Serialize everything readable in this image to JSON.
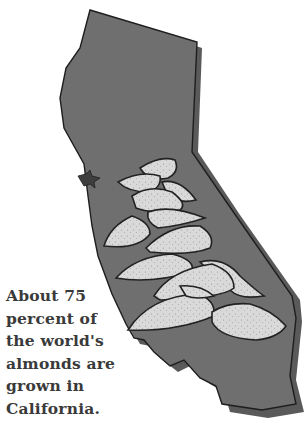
{
  "map": {
    "region": "California",
    "style": "grayscale illustration",
    "colors": {
      "state_fill": "#6f6f6f",
      "state_shadow": "#5a5a5a",
      "outline": "#1e1e1e",
      "almond_fill": "#d9d9d9",
      "background": "#ffffff",
      "caption_text": "#3a3a3a"
    },
    "almond_count": 13
  },
  "caption": {
    "lines": [
      "About 75",
      "percent of",
      "the world's",
      "almonds are",
      "grown in",
      "California."
    ]
  }
}
